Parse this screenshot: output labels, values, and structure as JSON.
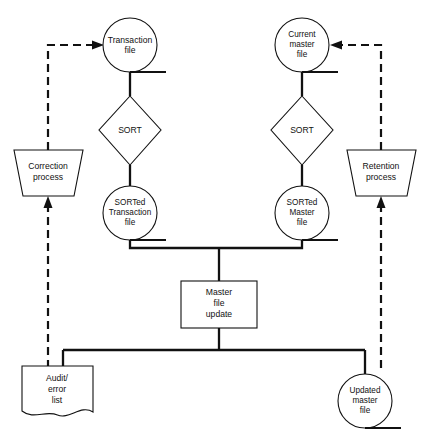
{
  "diagram": {
    "colors": {
      "background": "#ffffff",
      "stroke": "#111111",
      "fill": "#ffffff"
    },
    "nodes": {
      "transaction_file": {
        "shape": "magnetic-tape",
        "lines": [
          "Transaction",
          "file"
        ]
      },
      "sort_left": {
        "shape": "decision-diamond",
        "lines": [
          "SORT"
        ]
      },
      "sorted_transaction_file": {
        "shape": "magnetic-tape",
        "lines": [
          "SORTed",
          "Transaction",
          "file"
        ]
      },
      "correction_process": {
        "shape": "manual-operation-trapezoid",
        "lines": [
          "Correction",
          "process"
        ]
      },
      "current_master_file": {
        "shape": "magnetic-tape",
        "lines": [
          "Current",
          "master",
          "file"
        ]
      },
      "sort_right": {
        "shape": "decision-diamond",
        "lines": [
          "SORT"
        ]
      },
      "sorted_master_file": {
        "shape": "magnetic-tape",
        "lines": [
          "SORTed",
          "Master",
          "file"
        ]
      },
      "retention_process": {
        "shape": "manual-operation-trapezoid",
        "lines": [
          "Retention",
          "process"
        ]
      },
      "master_file_update": {
        "shape": "process-rectangle",
        "lines": [
          "Master",
          "file",
          "update"
        ]
      },
      "audit_error_list": {
        "shape": "document",
        "lines": [
          "Audit/",
          "error",
          "list"
        ]
      },
      "updated_master_file": {
        "shape": "magnetic-tape",
        "lines": [
          "Updated",
          "master",
          "file"
        ]
      }
    },
    "connectors": [
      {
        "name": "transaction-to-sort-left",
        "style": "solid",
        "arrow": false
      },
      {
        "name": "sort-left-to-sorted-transaction",
        "style": "solid",
        "arrow": false
      },
      {
        "name": "sorted-transaction-to-bus",
        "style": "solid",
        "arrow": false
      },
      {
        "name": "current-master-to-sort-right",
        "style": "solid",
        "arrow": false
      },
      {
        "name": "sort-right-to-sorted-master",
        "style": "solid",
        "arrow": false
      },
      {
        "name": "sorted-master-to-bus",
        "style": "solid",
        "arrow": false
      },
      {
        "name": "bus-to-master-file-update",
        "style": "solid",
        "arrow": false
      },
      {
        "name": "master-file-update-to-output-bus",
        "style": "solid",
        "arrow": false
      },
      {
        "name": "output-bus-to-audit-error-list",
        "style": "solid",
        "arrow": false
      },
      {
        "name": "output-bus-to-updated-master-file",
        "style": "solid",
        "arrow": false
      },
      {
        "name": "audit-error-list-to-correction-process",
        "style": "dashed",
        "arrow": true
      },
      {
        "name": "correction-process-to-transaction-file",
        "style": "dashed",
        "arrow": true
      },
      {
        "name": "updated-master-file-to-retention-process",
        "style": "dashed",
        "arrow": true
      },
      {
        "name": "retention-process-to-current-master-file",
        "style": "dashed",
        "arrow": true
      }
    ]
  }
}
